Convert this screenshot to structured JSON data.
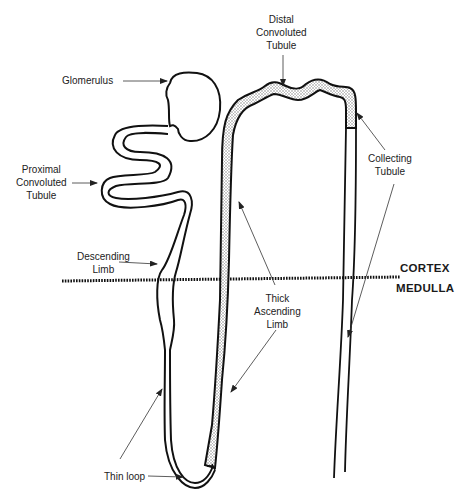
{
  "labels": {
    "glomerulus": [
      "Glomerulus"
    ],
    "proximal": [
      "Proximal",
      "Convoluted",
      "Tubule"
    ],
    "distal": [
      "Distal",
      "Convoluted",
      "Tubule"
    ],
    "collecting": [
      "Collecting",
      "Tubule"
    ],
    "descending": [
      "Descending",
      "Limb"
    ],
    "thick_ascending": [
      "Thick",
      "Ascending",
      "Limb"
    ],
    "thin_loop": [
      "Thin loop"
    ]
  },
  "zones": {
    "cortex": "CORTEX",
    "medulla": "MEDULLA"
  },
  "colors": {
    "outline": "#111111",
    "stipple": "#bdbdbd",
    "background": "#ffffff",
    "leader": "#333333"
  }
}
